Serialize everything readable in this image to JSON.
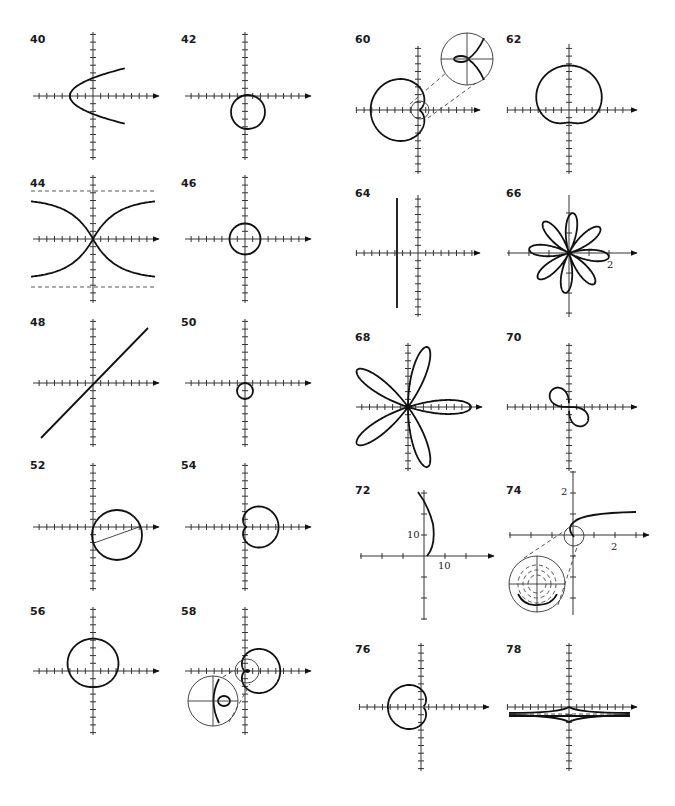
{
  "page": {
    "background": "#ffffff",
    "ink_color": "#111111"
  },
  "panels": [
    {
      "id": "40",
      "label": "40",
      "label_pos": [
        32,
        40
      ],
      "origin": [
        93,
        96
      ],
      "curve": "parabola opening right, vertex at x=-3"
    },
    {
      "id": "42",
      "label": "42",
      "label_pos": [
        183,
        40
      ],
      "origin": [
        245,
        96
      ],
      "curve": "circle below x-axis, tangent at origin"
    },
    {
      "id": "44",
      "label": "44",
      "label_pos": [
        32,
        183
      ],
      "origin": [
        93,
        239
      ],
      "curve": "hyperbola-like with horizontal dashed asymptotes"
    },
    {
      "id": "46",
      "label": "46",
      "label_pos": [
        183,
        183
      ],
      "origin": [
        245,
        239
      ],
      "curve": "circle centered at origin, radius 2"
    },
    {
      "id": "48",
      "label": "48",
      "label_pos": [
        32,
        322
      ],
      "origin": [
        93,
        383
      ],
      "curve": "line through origin, slope 1"
    },
    {
      "id": "50",
      "label": "50",
      "label_pos": [
        183,
        322
      ],
      "origin": [
        245,
        383
      ],
      "curve": "small circle below origin"
    },
    {
      "id": "52",
      "label": "52",
      "label_pos": [
        32,
        465
      ],
      "origin": [
        93,
        527
      ],
      "curve": "circle through origin with chord"
    },
    {
      "id": "54",
      "label": "54",
      "label_pos": [
        183,
        465
      ],
      "origin": [
        245,
        527
      ],
      "curve": "cardioid opening right"
    },
    {
      "id": "56",
      "label": "56",
      "label_pos": [
        32,
        610
      ],
      "origin": [
        93,
        671
      ],
      "curve": "cardioid upward"
    },
    {
      "id": "58",
      "label": "58",
      "label_pos": [
        183,
        610
      ],
      "origin": [
        245,
        671
      ],
      "curve": "limacon with inner loop, magnified inset"
    },
    {
      "id": "60",
      "label": "60",
      "label_pos": [
        356,
        40
      ],
      "origin": [
        418,
        110
      ],
      "curve": "limacon opening left, magnified inset"
    },
    {
      "id": "62",
      "label": "62",
      "label_pos": [
        507,
        40
      ],
      "origin": [
        569,
        110
      ],
      "curve": "dimpled limacon"
    },
    {
      "id": "64",
      "label": "64",
      "label_pos": [
        356,
        193
      ],
      "origin": [
        418,
        253
      ],
      "curve": "vertical line x=-3"
    },
    {
      "id": "66",
      "label": "66",
      "label_pos": [
        507,
        193
      ],
      "origin": [
        569,
        253
      ],
      "curve": "8-petal rose",
      "tick_labels": [
        "2"
      ]
    },
    {
      "id": "68",
      "label": "68",
      "label_pos": [
        356,
        336
      ],
      "origin": [
        408,
        407
      ],
      "curve": "5-petal rose"
    },
    {
      "id": "70",
      "label": "70",
      "label_pos": [
        507,
        336
      ],
      "origin": [
        569,
        407
      ],
      "curve": "lemniscate in quadrants II and IV"
    },
    {
      "id": "72",
      "label": "72",
      "label_pos": [
        356,
        490
      ],
      "origin": [
        424,
        556
      ],
      "curve": "spiral arc",
      "tick_labels": [
        "10",
        "10"
      ]
    },
    {
      "id": "74",
      "label": "74",
      "label_pos": [
        507,
        490
      ],
      "origin": [
        573,
        535
      ],
      "curve": "hyperbolic spiral with inset",
      "tick_labels": [
        "2",
        "2"
      ]
    },
    {
      "id": "76",
      "label": "76",
      "label_pos": [
        356,
        648
      ],
      "origin": [
        421,
        707
      ],
      "curve": "cardioid opening left"
    },
    {
      "id": "78",
      "label": "78",
      "label_pos": [
        507,
        648
      ],
      "origin": [
        569,
        707
      ],
      "curve": "conchoid with dashed asymptote"
    }
  ],
  "labels": {
    "p40": "40",
    "p42": "42",
    "p44": "44",
    "p46": "46",
    "p48": "48",
    "p50": "50",
    "p52": "52",
    "p54": "54",
    "p56": "56",
    "p58": "58",
    "p60": "60",
    "p62": "62",
    "p64": "64",
    "p66": "66",
    "p68": "68",
    "p70": "70",
    "p72": "72",
    "p74": "74",
    "p76": "76",
    "p78": "78"
  },
  "tick_labels": {
    "p66_x": "2",
    "p72_y": "10",
    "p72_x": "10",
    "p74_y": "2",
    "p74_x": "2"
  }
}
